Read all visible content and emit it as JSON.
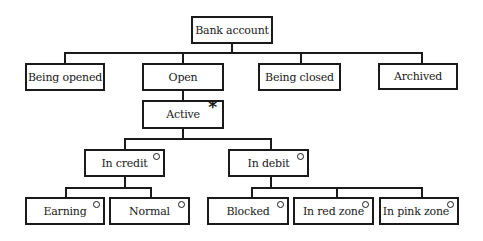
{
  "diagram": {
    "type": "state hierarchy",
    "root": {
      "label": "Bank account"
    },
    "level1": [
      {
        "label": "Being opened"
      },
      {
        "label": "Open"
      },
      {
        "label": "Being closed"
      },
      {
        "label": "Archived"
      }
    ],
    "open_child": {
      "label": "Active",
      "marker": "*"
    },
    "level3": [
      {
        "label": "In credit",
        "marker": "o"
      },
      {
        "label": "In debit",
        "marker": "o"
      }
    ],
    "credit_children": [
      {
        "label": "Earning",
        "marker": "o"
      },
      {
        "label": "Normal",
        "marker": "o"
      }
    ],
    "debit_children": [
      {
        "label": "Blocked",
        "marker": "o"
      },
      {
        "label": "In red zone",
        "marker": "o"
      },
      {
        "label": "In pink zone",
        "marker": "o"
      }
    ]
  }
}
